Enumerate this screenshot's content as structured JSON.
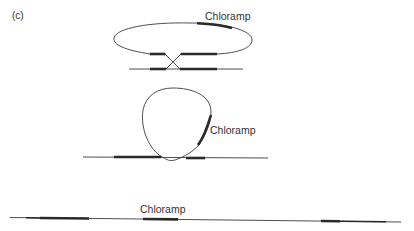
{
  "figure": {
    "panel_label": "(c)",
    "stages": [
      {
        "name": "plasmid-aligned-with-chromosome",
        "marker_label": "Chloramp",
        "description": "Circular plasmid carrying homologous regions aligned with chromosome; crossover between them"
      },
      {
        "name": "crossover-intermediate",
        "marker_label": "Chloramp",
        "description": "Plasmid loop joined to chromosome at crossover point"
      },
      {
        "name": "integrated-chromosome",
        "marker_label": "Chloramp",
        "description": "Linear chromosome with integrated plasmid and duplicated homologous regions"
      }
    ]
  },
  "colors": {
    "line": "#3a3a3a",
    "homology_block": "#2a2a2a",
    "text": "#333333",
    "background": "#ffffff"
  }
}
